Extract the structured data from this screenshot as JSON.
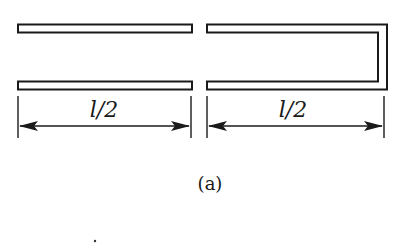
{
  "figure": {
    "caption": "(a)",
    "left_part": {
      "description": "two separated parallel conductor bars",
      "dimension_label": "l/2"
    },
    "right_part": {
      "description": "two parallel bars joined at the right end (U-shaped)",
      "dimension_label": "l/2"
    },
    "colors": {
      "ink": "#1a1a1a",
      "background": "#ffffff"
    }
  }
}
